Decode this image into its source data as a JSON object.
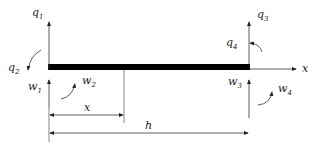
{
  "diagram": {
    "type": "beam-element-dofs",
    "labels": {
      "q1": {
        "base": "q",
        "sub": "1"
      },
      "q2": {
        "base": "q",
        "sub": "2"
      },
      "q3": {
        "base": "q",
        "sub": "3"
      },
      "q4": {
        "base": "q",
        "sub": "4"
      },
      "w1": {
        "base": "w",
        "sub": "1"
      },
      "w2": {
        "base": "w",
        "sub": "2"
      },
      "w3": {
        "base": "w",
        "sub": "3"
      },
      "w4": {
        "base": "w",
        "sub": "4"
      },
      "x_axis": "x",
      "x_dim": "x",
      "h_dim": "h"
    },
    "colors": {
      "line": "#333333",
      "beam": "#000000"
    }
  }
}
